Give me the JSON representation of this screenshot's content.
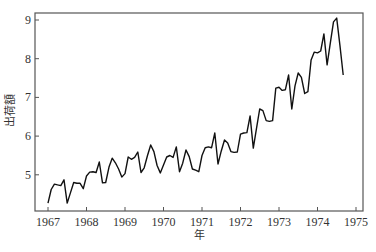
{
  "chart_data": {
    "type": "line",
    "title": "",
    "xlabel": "年",
    "ylabel": "出荷額",
    "xlim": [
      1966.85,
      1975.18
    ],
    "ylim": [
      4.1,
      9.18
    ],
    "grid": false,
    "legend": null,
    "x_ticks": [
      1967,
      1968,
      1969,
      1970,
      1971,
      1972,
      1973,
      1974,
      1975
    ],
    "y_ticks": [
      5,
      6,
      7,
      8,
      9
    ],
    "x_start": 1967.0,
    "x_step": 0.08333,
    "series": [
      {
        "name": "出荷額",
        "color": "#111111",
        "values": [
          4.27,
          4.62,
          4.76,
          4.74,
          4.72,
          4.87,
          4.27,
          4.54,
          4.8,
          4.78,
          4.78,
          4.64,
          4.97,
          5.07,
          5.08,
          5.06,
          5.33,
          4.79,
          4.8,
          5.2,
          5.43,
          5.31,
          5.15,
          4.94,
          5.03,
          5.46,
          5.4,
          5.45,
          5.59,
          5.06,
          5.18,
          5.5,
          5.77,
          5.6,
          5.24,
          5.05,
          5.25,
          5.46,
          5.5,
          5.45,
          5.72,
          5.08,
          5.3,
          5.64,
          5.47,
          5.15,
          5.12,
          5.08,
          5.5,
          5.7,
          5.72,
          5.7,
          6.08,
          5.28,
          5.61,
          5.9,
          5.82,
          5.6,
          5.58,
          5.59,
          6.05,
          6.08,
          6.09,
          6.52,
          5.69,
          6.2,
          6.7,
          6.66,
          6.4,
          6.38,
          6.4,
          7.24,
          7.26,
          7.18,
          7.2,
          7.58,
          6.7,
          7.3,
          7.63,
          7.52,
          7.1,
          7.15,
          7.97,
          8.17,
          8.15,
          8.2,
          8.64,
          7.84,
          8.4,
          8.95,
          9.05,
          8.35,
          7.58
        ]
      }
    ]
  },
  "layout": {
    "plot_left": 35,
    "plot_right": 363,
    "plot_top": 13,
    "plot_bottom": 211,
    "x_px_1967": 48,
    "x_px_per_year": 38.5,
    "y_px_9": 20,
    "y_px_per_unit": 38.7
  }
}
